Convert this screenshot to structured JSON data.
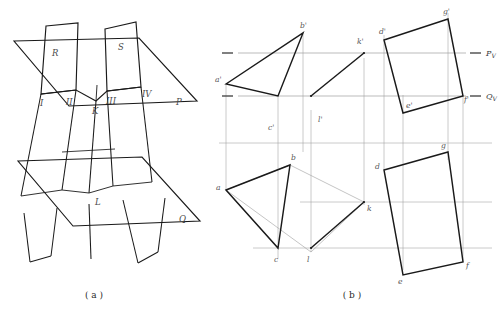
{
  "figure": {
    "title_a": "( a )",
    "title_b": "( b )",
    "pictorial": {
      "plane_upper_left_label": "R",
      "plane_upper_right_label": "S",
      "plane_horizontal_upper_label": "P",
      "plane_horizontal_lower_label": "Q",
      "point_1": "I",
      "point_2": "II",
      "point_3": "III",
      "point_4": "IV",
      "point_k": "K",
      "point_l": "L"
    },
    "projection": {
      "trace_pv": "P",
      "trace_pv_sub": "V",
      "trace_qv": "Q",
      "trace_qv_sub": "V",
      "front_view": {
        "triangle": [
          "a'",
          "b'",
          "c'"
        ],
        "line": [
          "k'",
          "l'"
        ],
        "quad": [
          "d'",
          "g'",
          "f'",
          "e'"
        ]
      },
      "top_view": {
        "triangle": [
          "a",
          "b",
          "c"
        ],
        "line": [
          "k",
          "l"
        ],
        "quad": [
          "d",
          "g",
          "f",
          "e"
        ]
      }
    }
  },
  "colors": {
    "ink": "#1a1a1a",
    "thin": "#8a8a8a",
    "trace": "#9a9a9a",
    "label": "#4a4a4a"
  }
}
